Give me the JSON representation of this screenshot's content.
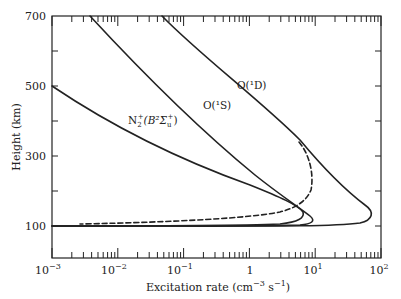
{
  "chart_data": {
    "type": "line",
    "title": "",
    "xlabel": "Excitation rate (cm⁻³ s⁻¹)",
    "ylabel": "Height (km)",
    "xscale": "log",
    "xlim": [
      0.001,
      100
    ],
    "ylim": [
      10,
      700
    ],
    "x_tick_labels": [
      "10⁻³",
      "10⁻²",
      "10⁻¹",
      "1",
      "10¹",
      "10²"
    ],
    "x_tick_values": [
      0.001,
      0.01,
      0.1,
      1,
      10,
      100
    ],
    "y_tick_labels": [
      "100",
      "300",
      "500",
      "700"
    ],
    "y_tick_values": [
      100,
      300,
      500,
      700
    ],
    "y_minor_ticks": [
      200,
      400,
      600
    ],
    "grid": false,
    "legend": "inline labels",
    "series": [
      {
        "name": "O(¹D)",
        "style": "solid",
        "points": [
          [
            0.047,
            700
          ],
          [
            0.3,
            600
          ],
          [
            1.5,
            500
          ],
          [
            4.5,
            400
          ],
          [
            8,
            330
          ],
          [
            15,
            260
          ],
          [
            30,
            190
          ],
          [
            60,
            150
          ],
          [
            68,
            134
          ],
          [
            40,
            112
          ],
          [
            10,
            103
          ],
          [
            1,
            101
          ],
          [
            0.001,
            100
          ]
        ]
      },
      {
        "name": "O(¹S)",
        "style": "solid",
        "points": [
          [
            0.0038,
            700
          ],
          [
            0.015,
            600
          ],
          [
            0.06,
            500
          ],
          [
            0.25,
            400
          ],
          [
            1,
            300
          ],
          [
            3,
            200
          ],
          [
            6,
            150
          ],
          [
            8,
            120
          ],
          [
            5,
            107
          ],
          [
            1,
            102
          ],
          [
            0.001,
            100
          ]
        ]
      },
      {
        "name": "N₂⁺(B²Σᵤ⁺)",
        "style": "solid",
        "points": [
          [
            0.001,
            500
          ],
          [
            0.005,
            420
          ],
          [
            0.03,
            350
          ],
          [
            0.2,
            280
          ],
          [
            1,
            220
          ],
          [
            3.5,
            170
          ],
          [
            6,
            131
          ],
          [
            3,
            108
          ],
          [
            0.5,
            102
          ],
          [
            0.001,
            100
          ]
        ]
      },
      {
        "name": "O(¹D) (dashed variant)",
        "style": "dashed",
        "points": [
          [
            5.5,
            334
          ],
          [
            8.5,
            280
          ],
          [
            9,
            246
          ],
          [
            7.5,
            200
          ],
          [
            4,
            154
          ],
          [
            1,
            128
          ],
          [
            0.1,
            112
          ],
          [
            0.01,
            106
          ],
          [
            0.003,
            104
          ]
        ]
      }
    ],
    "annotations": [
      {
        "text": "O(¹D)",
        "x": 4.5,
        "y": 530
      },
      {
        "text": "O(¹S)",
        "x": 1.2,
        "y": 470
      },
      {
        "text": "N₂⁺(B²Σᵤ⁺)",
        "x": 0.02,
        "y": 410
      }
    ]
  },
  "labels": {
    "y_title": "Height (km)",
    "x_title_main": "Excitation rate (cm",
    "x_title_sup1": "−3",
    "x_title_mid": " s",
    "x_title_sup2": "−1",
    "x_title_end": ")",
    "o1d": "O(¹D)",
    "o1s": "O(¹S)",
    "n2_base": "N",
    "n2_sub": "2",
    "n2_sup": "+",
    "n2_rest": "(B²Σ",
    "n2_sub_u": "u",
    "n2_sup2": "+",
    "n2_close": ")"
  },
  "ticks": {
    "y": [
      "700",
      "500",
      "300",
      "100"
    ],
    "x": [
      "10",
      "10",
      "10",
      "1",
      "10",
      "10"
    ],
    "x_exp": [
      "−3",
      "−2",
      "−1",
      "",
      "1",
      "2"
    ]
  }
}
